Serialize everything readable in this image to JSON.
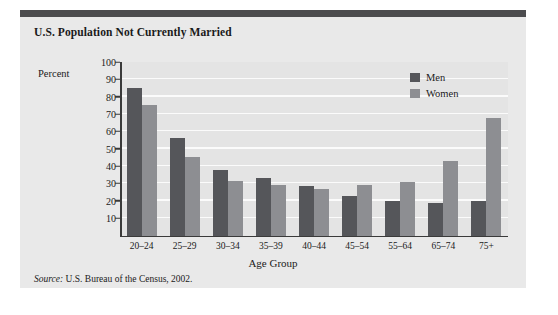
{
  "figure": {
    "title": "U.S. Population Not Currently Married",
    "source_word": "Source:",
    "source_text": " U.S. Bureau of the Census, 2002.",
    "colors": {
      "men": "#55565a",
      "women": "#8d8e92",
      "top_rule": "#4c4c4e",
      "panel_background": "#e9e9e9",
      "plot_background": "#e4e4e4",
      "gridline": "#fbfbfb",
      "axis": "#3a3a3a"
    }
  },
  "chart_data": {
    "type": "bar",
    "title": "U.S. Population Not Currently Married",
    "xlabel": "Age Group",
    "ylabel": "Percent",
    "ylim": [
      0,
      100
    ],
    "ytick_values": [
      10,
      20,
      30,
      40,
      50,
      60,
      70,
      80,
      90,
      100
    ],
    "ytick_labels": [
      "10",
      "20",
      "30",
      "40",
      "50",
      "60",
      "70",
      "80",
      "90",
      "100"
    ],
    "grid": "horizontal",
    "legend_position": "top-right",
    "categories": [
      "20–24",
      "25–29",
      "30–34",
      "35–39",
      "40–44",
      "45–54",
      "55–64",
      "65–74",
      "75+"
    ],
    "series": [
      {
        "name": "Men",
        "color": "#55565a",
        "values": [
          85,
          56,
          38,
          33,
          28.5,
          23,
          20,
          19,
          20
        ]
      },
      {
        "name": "Women",
        "color": "#8d8e92",
        "values": [
          75,
          45,
          31.5,
          29,
          27,
          29,
          31,
          43,
          68
        ]
      }
    ]
  }
}
